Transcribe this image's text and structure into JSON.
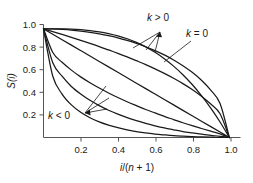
{
  "chart_data": {
    "type": "line",
    "title": "",
    "xlabel": "i/(n + 1)",
    "ylabel": "S(i)",
    "xlim": [
      0,
      1.06
    ],
    "ylim": [
      0,
      1.04
    ],
    "grid": false,
    "legend_position": "inline-annotations",
    "xticks": [
      0.2,
      0.4,
      0.6,
      0.8,
      1.0
    ],
    "xticklabels": [
      "0.2",
      "0.4",
      "0.6",
      "0.8",
      "1.0"
    ],
    "yticks": [
      0.2,
      0.4,
      0.6,
      0.8,
      1.0
    ],
    "yticklabels": [
      "0.2",
      "0.4",
      "0.6",
      "0.8",
      "1.0"
    ],
    "annotations": [
      {
        "text": "k > 0",
        "role": "upper-curves-label"
      },
      {
        "text": "k = 0",
        "role": "diagonal-label"
      },
      {
        "text": "k < 0",
        "role": "lower-curves-label"
      }
    ],
    "x": [
      0.0,
      0.05,
      0.1,
      0.15,
      0.2,
      0.25,
      0.3,
      0.35,
      0.4,
      0.45,
      0.5,
      0.55,
      0.6,
      0.65,
      0.7,
      0.75,
      0.8,
      0.85,
      0.9,
      0.95,
      1.0
    ],
    "series": [
      {
        "name": "k = 3",
        "k": 3,
        "group": "k > 0",
        "values": [
          1.0,
          1.0,
          0.999,
          0.997,
          0.992,
          0.984,
          0.973,
          0.957,
          0.936,
          0.909,
          0.875,
          0.834,
          0.784,
          0.725,
          0.657,
          0.578,
          0.488,
          0.386,
          0.271,
          0.143,
          0.0
        ]
      },
      {
        "name": "k = 2",
        "k": 2,
        "group": "k > 0",
        "values": [
          1.0,
          0.999,
          0.995,
          0.989,
          0.98,
          0.968,
          0.954,
          0.937,
          0.917,
          0.893,
          0.866,
          0.835,
          0.8,
          0.76,
          0.714,
          0.661,
          0.6,
          0.527,
          0.436,
          0.312,
          0.0
        ]
      },
      {
        "name": "k = 1",
        "k": 1,
        "group": "k > 0",
        "values": [
          1.0,
          0.975,
          0.949,
          0.922,
          0.894,
          0.866,
          0.837,
          0.806,
          0.775,
          0.742,
          0.707,
          0.671,
          0.632,
          0.59,
          0.545,
          0.496,
          0.442,
          0.38,
          0.308,
          0.218,
          0.0
        ]
      },
      {
        "name": "k = 0",
        "k": 0,
        "group": "k = 0",
        "values": [
          1.0,
          0.95,
          0.9,
          0.85,
          0.8,
          0.75,
          0.7,
          0.65,
          0.6,
          0.55,
          0.5,
          0.45,
          0.4,
          0.35,
          0.3,
          0.25,
          0.2,
          0.15,
          0.1,
          0.05,
          0.0
        ]
      },
      {
        "name": "k = -1",
        "k": -1,
        "group": "k < 0",
        "values": [
          1.0,
          0.782,
          0.692,
          0.62,
          0.558,
          0.504,
          0.455,
          0.41,
          0.368,
          0.329,
          0.293,
          0.258,
          0.226,
          0.194,
          0.165,
          0.136,
          0.109,
          0.083,
          0.058,
          0.034,
          0.0
        ]
      },
      {
        "name": "k = -2",
        "k": -2,
        "group": "k < 0",
        "values": [
          1.0,
          0.688,
          0.564,
          0.47,
          0.4,
          0.342,
          0.293,
          0.251,
          0.215,
          0.183,
          0.155,
          0.13,
          0.108,
          0.088,
          0.071,
          0.055,
          0.042,
          0.03,
          0.02,
          0.011,
          0.0
        ]
      },
      {
        "name": "k = -3",
        "k": -3,
        "group": "k < 0",
        "values": [
          1.0,
          0.564,
          0.4,
          0.3,
          0.232,
          0.182,
          0.144,
          0.114,
          0.09,
          0.071,
          0.055,
          0.043,
          0.032,
          0.024,
          0.017,
          0.012,
          0.008,
          0.005,
          0.003,
          0.001,
          0.0
        ]
      }
    ]
  },
  "axes": {
    "x_label_parts": {
      "var": "i",
      "slash": "/(",
      "n": "n",
      "tail": " + 1)"
    },
    "y_label_parts": {
      "s": "S(",
      "i": "i",
      "close": ")"
    }
  },
  "labels": {
    "k_positive": "k > 0",
    "k_positive_sym": "k",
    "k_positive_rel": " > 0",
    "k_zero_sym": "k",
    "k_zero_rel": " = 0",
    "k_negative_sym": "k",
    "k_negative_rel": " < 0"
  },
  "colors": {
    "curve": "#1a1a1a",
    "axis": "#555555",
    "text": "#1a1a1a",
    "background": "#ffffff"
  }
}
